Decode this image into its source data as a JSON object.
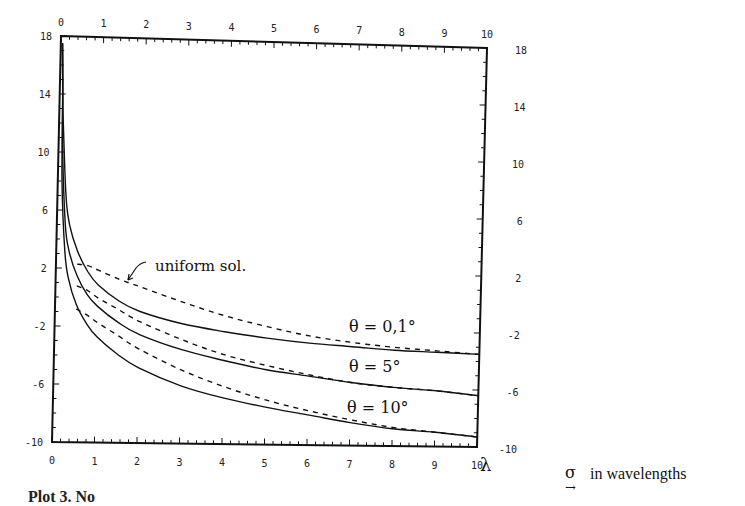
{
  "chart_data": {
    "type": "line",
    "title": "",
    "xlabel": "σ in wavelengths",
    "x_unit_symbol": "λ",
    "ylabel": "",
    "xlim": [
      0,
      10
    ],
    "ylim": [
      -10,
      18
    ],
    "x_ticks": [
      "0",
      "1",
      "2",
      "3",
      "4",
      "5",
      "6",
      "7",
      "8",
      "9",
      "10"
    ],
    "y_ticks_left": [
      "18",
      "14",
      "10",
      "6",
      "2",
      "-2",
      "-6",
      "-10"
    ],
    "y_ticks_right": [
      "18",
      "14",
      "10",
      "6",
      "2",
      "-2",
      "-6",
      "-10"
    ],
    "grid": false,
    "annotations": [
      {
        "text": "uniform sol.",
        "points_to": "dashed curves"
      },
      {
        "text": "θ = 0,1°"
      },
      {
        "text": "θ = 5°"
      },
      {
        "text": "θ = 10°"
      }
    ],
    "x": [
      0.1,
      0.2,
      0.3,
      0.5,
      0.75,
      1,
      1.5,
      2,
      3,
      4,
      5,
      6,
      7,
      8,
      9,
      10
    ],
    "series": [
      {
        "name": "θ = 0,1° (exact)",
        "style": "solid",
        "values": [
          12.0,
          7.0,
          5.0,
          3.2,
          1.8,
          0.9,
          -0.2,
          -0.9,
          -1.7,
          -2.2,
          -2.6,
          -2.9,
          -3.1,
          -3.3,
          -3.4,
          -3.5
        ]
      },
      {
        "name": "θ = 0,1° (uniform sol.)",
        "style": "dashed",
        "values": [
          null,
          null,
          null,
          2.3,
          2.2,
          1.9,
          1.3,
          0.8,
          -0.2,
          -1.1,
          -1.8,
          -2.4,
          -2.8,
          -3.1,
          -3.3,
          -3.5
        ]
      },
      {
        "name": "θ = 5° (exact)",
        "style": "solid",
        "values": [
          10.0,
          5.0,
          3.2,
          1.5,
          0.2,
          -0.6,
          -1.7,
          -2.5,
          -3.5,
          -4.2,
          -4.8,
          -5.2,
          -5.6,
          -5.9,
          -6.1,
          -6.4
        ]
      },
      {
        "name": "θ = 5° (uniform sol.)",
        "style": "dashed",
        "values": [
          null,
          null,
          null,
          0.8,
          0.5,
          0.0,
          -0.8,
          -1.6,
          -2.8,
          -3.8,
          -4.5,
          -5.1,
          -5.6,
          -5.9,
          -6.1,
          -6.4
        ]
      },
      {
        "name": "θ = 10° (exact)",
        "style": "solid",
        "values": [
          8.0,
          3.2,
          1.3,
          -0.5,
          -1.8,
          -2.7,
          -3.9,
          -4.8,
          -6.0,
          -6.8,
          -7.4,
          -7.9,
          -8.4,
          -8.8,
          -9.0,
          -9.3
        ]
      },
      {
        "name": "θ = 10° (uniform sol.)",
        "style": "dashed",
        "values": [
          null,
          null,
          null,
          -0.8,
          -1.2,
          -1.7,
          -2.6,
          -3.5,
          -4.9,
          -6.0,
          -6.9,
          -7.6,
          -8.2,
          -8.7,
          -9.0,
          -9.3
        ]
      }
    ]
  },
  "labels": {
    "uniform": "uniform sol.",
    "theta1": "θ = 0,1°",
    "theta2": "θ = 5°",
    "theta3": "θ = 10°",
    "lambda": "λ",
    "sigma": "σ",
    "sigma_arrow": "→",
    "x_unit_text": "in wavelengths",
    "caption": "Plot 3. No"
  }
}
